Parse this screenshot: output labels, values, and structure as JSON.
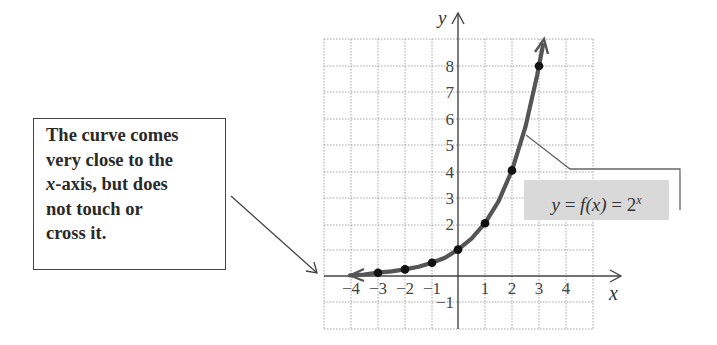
{
  "callout": {
    "lines": [
      "The curve comes",
      "very close to the",
      "x-axis, but does",
      "not touch or",
      "cross it."
    ],
    "italic_prefix": "x"
  },
  "formula": {
    "lhs": "y",
    "eq1": "=",
    "mid": "f(x)",
    "eq2": "=",
    "base": "2",
    "exponent": "x",
    "text": "y = f(x) = 2^x"
  },
  "axes": {
    "x_label": "x",
    "y_label": "y",
    "x_ticks": [
      "−4",
      "−3",
      "−2",
      "−1",
      "1",
      "2",
      "3",
      "4"
    ],
    "y_ticks": [
      "8",
      "7",
      "6",
      "5",
      "4",
      "3",
      "2",
      "−1"
    ]
  },
  "colors": {
    "curve": "#555555",
    "points": "#111111",
    "grid": "#9a9a9a",
    "axis": "#444444",
    "formula_bg": "#d9d9d9",
    "text": "#333333"
  },
  "chart_data": {
    "type": "line",
    "title": "",
    "function": "f(x) = 2^x",
    "xlabel": "x",
    "ylabel": "y",
    "x": [
      -3,
      -2,
      -1,
      0,
      1,
      2,
      3
    ],
    "values": [
      0.125,
      0.25,
      0.5,
      1,
      2,
      4,
      8
    ],
    "series": [
      {
        "name": "y = f(x) = 2^x",
        "x": [
          -3,
          -2,
          -1,
          0,
          1,
          2,
          3
        ],
        "values": [
          0.125,
          0.25,
          0.5,
          1,
          2,
          4,
          8
        ]
      }
    ],
    "xlim": [
      -5,
      5
    ],
    "ylim": [
      -2,
      9
    ],
    "x_tick_labels": [
      -4,
      -3,
      -2,
      -1,
      1,
      2,
      3,
      4
    ],
    "y_tick_labels": [
      -1,
      2,
      3,
      4,
      5,
      6,
      7,
      8
    ],
    "grid": true,
    "annotations": [
      "The curve comes very close to the x-axis, but does not touch or cross it.",
      "y = f(x) = 2^x"
    ],
    "asymptote": "y = 0 (horizontal)"
  }
}
